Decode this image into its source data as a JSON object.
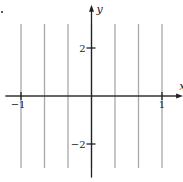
{
  "chart_data": {
    "type": "line",
    "title": "",
    "xlabel": "x",
    "ylabel": "y",
    "xlim": [
      -1.25,
      1.3
    ],
    "ylim": [
      -3.4,
      3.8
    ],
    "grid": false,
    "x_ticks": [
      {
        "value": -1,
        "label": "−1"
      },
      {
        "value": 1,
        "label": "1"
      }
    ],
    "y_ticks": [
      {
        "value": 2,
        "label": "2"
      },
      {
        "value": -2,
        "label": "−2"
      }
    ],
    "series": [
      {
        "name": "x=-1",
        "points": [
          [
            -1,
            -3
          ],
          [
            -1,
            3
          ]
        ]
      },
      {
        "name": "x=-2/3",
        "points": [
          [
            -0.6667,
            -3
          ],
          [
            -0.6667,
            3
          ]
        ]
      },
      {
        "name": "x=-1/3",
        "points": [
          [
            -0.3333,
            -3
          ],
          [
            -0.3333,
            3
          ]
        ]
      },
      {
        "name": "x=0",
        "points": [
          [
            0,
            -3
          ],
          [
            0,
            3
          ]
        ]
      },
      {
        "name": "x=1/3",
        "points": [
          [
            0.3333,
            -3
          ],
          [
            0.3333,
            3
          ]
        ]
      },
      {
        "name": "x=2/3",
        "points": [
          [
            0.6667,
            -3
          ],
          [
            0.6667,
            3
          ]
        ]
      },
      {
        "name": "x=1",
        "points": [
          [
            1,
            -3
          ],
          [
            1,
            3
          ]
        ]
      }
    ],
    "colors": {
      "curves": "#a8a8a8",
      "axes": "#222222"
    }
  }
}
